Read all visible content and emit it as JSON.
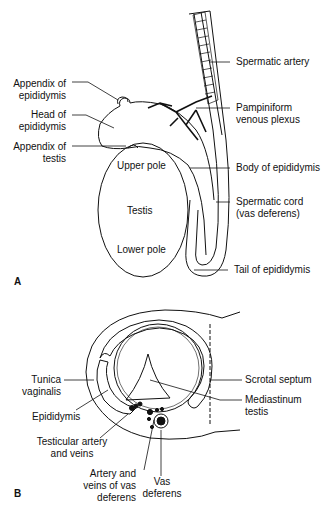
{
  "figure": {
    "panel_a": {
      "letter": "A",
      "inner_labels": {
        "upper_pole": "Upper pole",
        "testis": "Testis",
        "lower_pole": "Lower pole"
      },
      "left_labels": {
        "appendix_epididymis": [
          "Appendix of",
          "epididymis"
        ],
        "head_epididymis": [
          "Head of",
          "epididymis"
        ],
        "appendix_testis": [
          "Appendix of",
          "testis"
        ]
      },
      "right_labels": {
        "spermatic_artery": "Spermatic artery",
        "pampiniform": [
          "Pampiniform",
          "venous plexus"
        ],
        "body_epididymis": "Body of epididymis",
        "spermatic_cord": [
          "Spermatic cord",
          "(vas deferens)"
        ],
        "tail_epididymis": "Tail of epididymis"
      }
    },
    "panel_b": {
      "letter": "B",
      "left_labels": {
        "tunica": [
          "Tunica",
          "vaginalis"
        ],
        "epididymis": "Epididymis",
        "testicular_artery": [
          "Testicular artery",
          "and veins"
        ],
        "artery_vas": [
          "Artery and",
          "veins of vas",
          "deferens"
        ],
        "vas_deferens": [
          "Vas",
          "deferens"
        ]
      },
      "right_labels": {
        "scrotal_septum": "Scrotal septum",
        "mediastinum": [
          "Mediastinum",
          "testis"
        ]
      }
    }
  }
}
